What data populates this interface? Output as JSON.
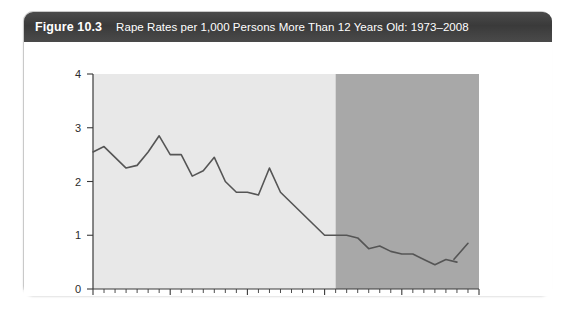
{
  "figure": {
    "number": "Figure 10.3",
    "title": "Rape Rates per 1,000 Persons More Than 12 Years Old: 1973–2008"
  },
  "chart_data": {
    "type": "line",
    "title": "Rape Rates per 1,000 Persons More Than 12 Years Old: 1973–2008",
    "xlabel": "",
    "ylabel": "",
    "xlim": [
      1973,
      2008
    ],
    "ylim": [
      0,
      4
    ],
    "yticks": [
      0,
      1,
      2,
      3,
      4
    ],
    "ytick_labels": [
      "0",
      "1",
      "2",
      "3",
      "4"
    ],
    "xticks": [
      1973,
      1980,
      1987,
      1994,
      2001,
      2008
    ],
    "xtick_labels": [
      "1973",
      "1980",
      "1987",
      "1994",
      "2001",
      "2008"
    ],
    "xtick_minor_every": 1,
    "grid": false,
    "legend": "none",
    "line_color": "#555555",
    "line_width": 1.6,
    "plot_background_left": "#e8e8e8",
    "plot_background_right": "#a8a8a8",
    "shaded_split_year": 1995,
    "series": [
      {
        "name": "Rape rate per 1,000 persons age 12+",
        "x": [
          1973,
          1974,
          1975,
          1976,
          1977,
          1978,
          1979,
          1980,
          1981,
          1982,
          1983,
          1984,
          1985,
          1986,
          1987,
          1988,
          1989,
          1990,
          1991,
          1992,
          1993,
          1994,
          1995,
          1996,
          1997,
          1998,
          1999,
          2000,
          2001,
          2002,
          2003,
          2004,
          2005,
          2006,
          2007
        ],
        "values": [
          2.55,
          2.65,
          2.45,
          2.25,
          2.3,
          2.55,
          2.85,
          2.5,
          2.5,
          2.1,
          2.2,
          2.45,
          2.0,
          1.8,
          1.8,
          1.75,
          2.25,
          1.8,
          1.6,
          1.4,
          1.2,
          1.0,
          1.0,
          1.0,
          0.95,
          0.75,
          0.8,
          0.7,
          0.65,
          0.65,
          0.55,
          0.45,
          0.55,
          0.5,
          0.85
        ]
      }
    ],
    "series_break": {
      "after_x": 2006,
      "note": "visual break in line before final upturn"
    }
  },
  "axis": {
    "y_label_0": "0",
    "y_label_1": "1",
    "y_label_2": "2",
    "y_label_3": "3",
    "y_label_4": "4",
    "x_label_1973": "1973",
    "x_label_1980": "1980",
    "x_label_1987": "1987",
    "x_label_1994": "1994",
    "x_label_2001": "2001",
    "x_label_2008": "2008"
  }
}
